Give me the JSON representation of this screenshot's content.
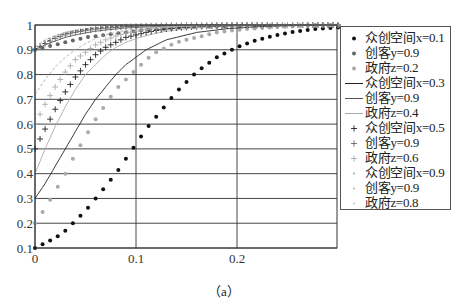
{
  "chart_data": {
    "type": "line",
    "title": "",
    "caption": "（a）",
    "xlabel": "",
    "ylabel": "",
    "xlim": [
      0,
      0.3
    ],
    "ylim": [
      0.1,
      1
    ],
    "x_ticks": [
      "0",
      "0.1",
      "0.2"
    ],
    "y_ticks": [
      "0.1",
      "0.2",
      "0.3",
      "0.4",
      "0.5",
      "0.6",
      "0.7",
      "0.8",
      "0.9",
      "1"
    ],
    "grid": true,
    "legend_position": "right",
    "x": [
      0,
      0.01,
      0.02,
      0.03,
      0.04,
      0.05,
      0.06,
      0.07,
      0.08,
      0.09,
      0.1,
      0.11,
      0.12,
      0.13,
      0.14,
      0.15,
      0.16,
      0.17,
      0.18,
      0.19,
      0.2,
      0.22,
      0.24,
      0.26,
      0.28,
      0.3
    ],
    "series": [
      {
        "name": "众创空间x=0.1",
        "group": 1,
        "style": "dot",
        "color": "#111111",
        "values": [
          0.1,
          0.12,
          0.14,
          0.17,
          0.21,
          0.25,
          0.3,
          0.35,
          0.4,
          0.46,
          0.52,
          0.58,
          0.63,
          0.68,
          0.73,
          0.77,
          0.81,
          0.84,
          0.87,
          0.89,
          0.91,
          0.94,
          0.96,
          0.975,
          0.985,
          0.99
        ]
      },
      {
        "name": "创客y=0.9",
        "group": 1,
        "style": "dot",
        "color": "#666666",
        "values": [
          0.9,
          0.91,
          0.92,
          0.93,
          0.94,
          0.95,
          0.955,
          0.96,
          0.965,
          0.97,
          0.975,
          0.98,
          0.983,
          0.986,
          0.988,
          0.99,
          0.992,
          0.993,
          0.994,
          0.995,
          0.996,
          0.997,
          0.998,
          0.998,
          0.999,
          0.999
        ]
      },
      {
        "name": "政府z=0.2",
        "group": 1,
        "style": "dot",
        "color": "#aaaaaa",
        "values": [
          0.2,
          0.26,
          0.33,
          0.4,
          0.48,
          0.55,
          0.62,
          0.68,
          0.74,
          0.78,
          0.82,
          0.86,
          0.89,
          0.91,
          0.93,
          0.94,
          0.95,
          0.96,
          0.97,
          0.975,
          0.98,
          0.987,
          0.992,
          0.995,
          0.997,
          0.998
        ]
      },
      {
        "name": "众创空间x=0.3",
        "group": 2,
        "style": "solid",
        "color": "#222222",
        "values": [
          0.3,
          0.36,
          0.43,
          0.5,
          0.57,
          0.64,
          0.7,
          0.75,
          0.8,
          0.84,
          0.87,
          0.9,
          0.92,
          0.94,
          0.95,
          0.96,
          0.97,
          0.975,
          0.98,
          0.985,
          0.988,
          0.993,
          0.996,
          0.998,
          0.999,
          0.999
        ]
      },
      {
        "name": "创客y=0.9",
        "group": 2,
        "style": "solid",
        "color": "#555555",
        "values": [
          0.9,
          0.92,
          0.935,
          0.95,
          0.96,
          0.968,
          0.975,
          0.98,
          0.984,
          0.988,
          0.99,
          0.992,
          0.994,
          0.995,
          0.996,
          0.997,
          0.998,
          0.998,
          0.999,
          0.999,
          0.999,
          1.0,
          1.0,
          1.0,
          1.0,
          1.0
        ]
      },
      {
        "name": "政府z=0.4",
        "group": 2,
        "style": "solid",
        "color": "#aaaaaa",
        "values": [
          0.4,
          0.5,
          0.59,
          0.67,
          0.74,
          0.8,
          0.84,
          0.88,
          0.91,
          0.93,
          0.945,
          0.957,
          0.967,
          0.975,
          0.98,
          0.985,
          0.988,
          0.991,
          0.993,
          0.995,
          0.996,
          0.998,
          0.999,
          0.999,
          1.0,
          1.0
        ]
      },
      {
        "name": "众创空间x=0.5",
        "group": 3,
        "style": "plus",
        "color": "#222222",
        "values": [
          0.5,
          0.58,
          0.66,
          0.73,
          0.79,
          0.84,
          0.88,
          0.91,
          0.93,
          0.95,
          0.96,
          0.97,
          0.978,
          0.984,
          0.988,
          0.991,
          0.993,
          0.995,
          0.996,
          0.997,
          0.998,
          0.999,
          0.999,
          1.0,
          1.0,
          1.0
        ]
      },
      {
        "name": "创客y=0.9",
        "group": 3,
        "style": "plus",
        "color": "#666666",
        "values": [
          0.9,
          0.925,
          0.945,
          0.96,
          0.97,
          0.977,
          0.983,
          0.987,
          0.99,
          0.993,
          0.995,
          0.996,
          0.997,
          0.998,
          0.998,
          0.999,
          0.999,
          0.999,
          1.0,
          1.0,
          1.0,
          1.0,
          1.0,
          1.0,
          1.0,
          1.0
        ]
      },
      {
        "name": "政府z=0.6",
        "group": 3,
        "style": "plus",
        "color": "#aaaaaa",
        "values": [
          0.6,
          0.68,
          0.75,
          0.81,
          0.86,
          0.89,
          0.92,
          0.94,
          0.955,
          0.967,
          0.975,
          0.982,
          0.987,
          0.99,
          0.993,
          0.995,
          0.996,
          0.997,
          0.998,
          0.999,
          0.999,
          1.0,
          1.0,
          1.0,
          1.0,
          1.0
        ]
      },
      {
        "name": "众创空间x=0.9",
        "group": 4,
        "style": "dash",
        "color": "#333333",
        "values": [
          0.9,
          0.93,
          0.95,
          0.965,
          0.975,
          0.982,
          0.987,
          0.991,
          0.994,
          0.996,
          0.997,
          0.998,
          0.998,
          0.999,
          0.999,
          0.999,
          1.0,
          1.0,
          1.0,
          1.0,
          1.0,
          1.0,
          1.0,
          1.0,
          1.0,
          1.0
        ]
      },
      {
        "name": "创客y=0.9",
        "group": 4,
        "style": "dash",
        "color": "#777777",
        "values": [
          0.91,
          0.94,
          0.957,
          0.97,
          0.978,
          0.985,
          0.99,
          0.993,
          0.995,
          0.996,
          0.997,
          0.998,
          0.999,
          0.999,
          0.999,
          1.0,
          1.0,
          1.0,
          1.0,
          1.0,
          1.0,
          1.0,
          1.0,
          1.0,
          1.0,
          1.0
        ]
      },
      {
        "name": "政府z=0.8",
        "group": 4,
        "style": "dash",
        "color": "#aaaaaa",
        "values": [
          0.72,
          0.78,
          0.83,
          0.87,
          0.9,
          0.925,
          0.945,
          0.96,
          0.97,
          0.978,
          0.984,
          0.988,
          0.991,
          0.994,
          0.995,
          0.997,
          0.998,
          0.998,
          0.999,
          0.999,
          0.999,
          1.0,
          1.0,
          1.0,
          1.0,
          1.0
        ]
      }
    ]
  },
  "legend": {
    "items": [
      {
        "label": "众创空间x=0.1",
        "marker": "dot",
        "color": "#111111"
      },
      {
        "label": "创客y=0.9",
        "marker": "dot",
        "color": "#666666"
      },
      {
        "label": "政府z=0.2",
        "marker": "dot",
        "color": "#aaaaaa"
      },
      {
        "label": "众创空间x=0.3",
        "marker": "line",
        "color": "#222222"
      },
      {
        "label": "创客y=0.9",
        "marker": "line",
        "color": "#555555"
      },
      {
        "label": "政府z=0.4",
        "marker": "line",
        "color": "#aaaaaa"
      },
      {
        "label": "众创空间x=0.5",
        "marker": "plus",
        "color": "#222222"
      },
      {
        "label": "创客y=0.9",
        "marker": "plus",
        "color": "#666666"
      },
      {
        "label": "政府z=0.6",
        "marker": "plus",
        "color": "#aaaaaa"
      },
      {
        "label": "众创空间x=0.9",
        "marker": "dash",
        "color": "#999999"
      },
      {
        "label": "创客y=0.9",
        "marker": "dash",
        "color": "#aaaaaa"
      },
      {
        "label": "政府z=0.8",
        "marker": "dash",
        "color": "#bbbbbb"
      }
    ]
  },
  "caption": "（a）"
}
